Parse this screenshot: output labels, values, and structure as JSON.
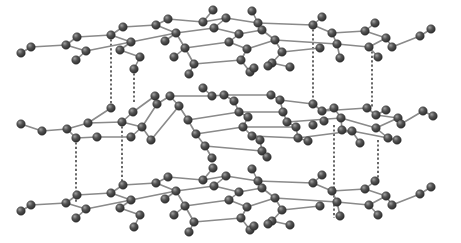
{
  "diagram": {
    "stacking": "ABA",
    "layers": [
      {
        "name": "top-layer",
        "registry": "A"
      },
      {
        "name": "middle-layer",
        "registry": "B"
      },
      {
        "name": "bottom-layer",
        "registry": "A"
      }
    ],
    "rings_across": 4,
    "rings_deep": 3,
    "interlayer_links": [
      {
        "between": [
          "top-layer",
          "middle-layer"
        ],
        "count": 4
      },
      {
        "between": [
          "middle-layer",
          "bottom-layer"
        ],
        "count": 4
      }
    ],
    "atom_element": "carbon",
    "colors": {
      "background": "#ffffff",
      "atom": "#4a4a4a",
      "atom_highlight": "#9a9a9a",
      "bond": "#8a8a8a",
      "interlayer_line": "#2a2a2a"
    }
  }
}
